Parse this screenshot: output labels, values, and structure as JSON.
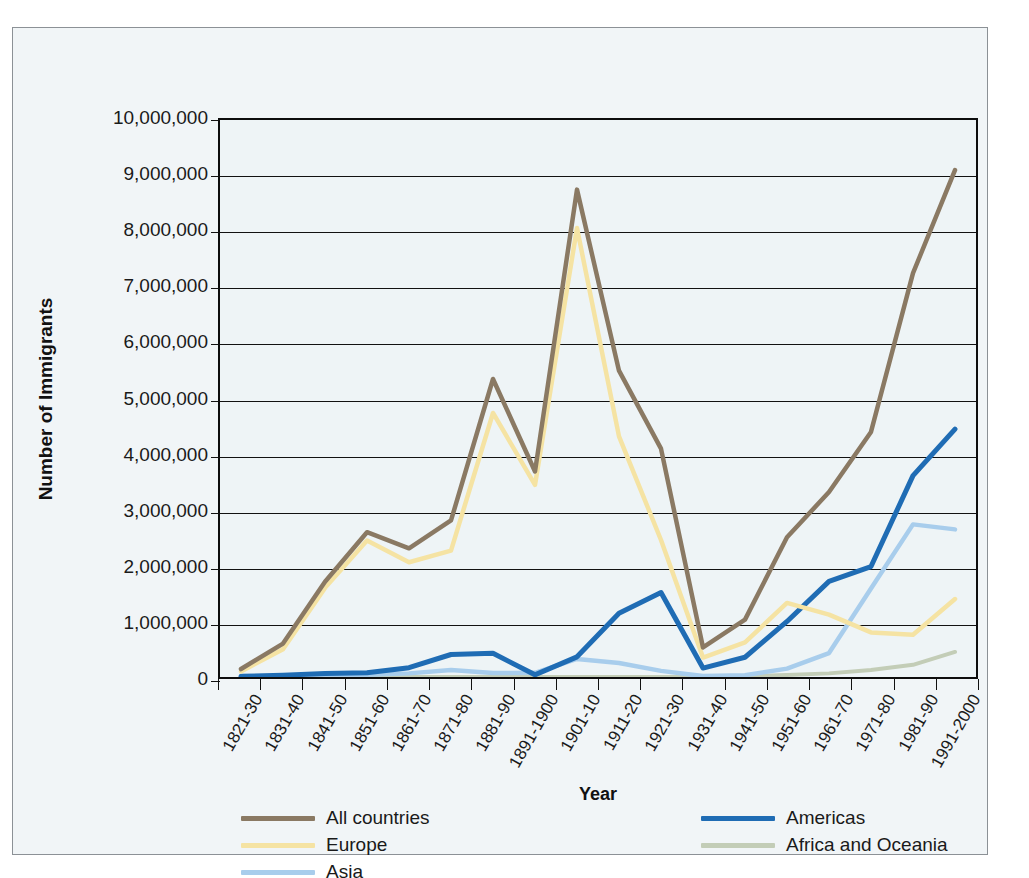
{
  "chart_data": {
    "type": "line",
    "title": "",
    "xlabel": "Year",
    "ylabel": "Number of Immigrants",
    "ylim": [
      0,
      10000000
    ],
    "ytick_step": 1000000,
    "grid": true,
    "legend_position": "bottom",
    "ytick_labels": [
      "0",
      "1,000,000",
      "2,000,000",
      "3,000,000",
      "4,000,000",
      "5,000,000",
      "6,000,000",
      "7,000,000",
      "8,000,000",
      "9,000,000",
      "10,000,000"
    ],
    "categories": [
      "1821-30",
      "1831-40",
      "1841-50",
      "1851-60",
      "1861-70",
      "1871-80",
      "1881-90",
      "1891-1900",
      "1901-10",
      "1911-20",
      "1921-30",
      "1931-40",
      "1941-50",
      "1951-60",
      "1961-70",
      "1971-80",
      "1981-90",
      "1991-2000"
    ],
    "series": [
      {
        "name": "All countries",
        "color": "#8a7963",
        "values": [
          143000,
          600000,
          1710000,
          2600000,
          2310000,
          2810000,
          5350000,
          3690000,
          8750000,
          5500000,
          4100000,
          530000,
          1030000,
          2510000,
          3320000,
          4400000,
          7250000,
          9100000
        ]
      },
      {
        "name": "Europe",
        "color": "#f5e3a3",
        "values": [
          100000,
          500000,
          1600000,
          2450000,
          2060000,
          2270000,
          4740000,
          3450000,
          8060000,
          4320000,
          2460000,
          350000,
          620000,
          1330000,
          1120000,
          800000,
          760000,
          1400000
        ]
      },
      {
        "name": "Asia",
        "color": "#a8cdec",
        "values": [
          0,
          0,
          0,
          42000,
          65000,
          125000,
          70000,
          75000,
          325000,
          250000,
          110000,
          16000,
          32000,
          150000,
          430000,
          1590000,
          2740000,
          2650000
        ]
      },
      {
        "name": "Americas",
        "color": "#1f6cb4",
        "values": [
          12000,
          33000,
          62000,
          75000,
          167000,
          404000,
          427000,
          39000,
          362000,
          1144000,
          1517000,
          160000,
          355000,
          997000,
          1716000,
          1983000,
          3615000,
          4450000
        ]
      },
      {
        "name": "Africa and Oceania",
        "color": "#c3cdb7",
        "values": [
          0,
          0,
          0,
          0,
          0,
          0,
          0,
          0,
          0,
          0,
          0,
          0,
          14000,
          36000,
          65000,
          125000,
          218000,
          450000
        ]
      }
    ]
  },
  "axis": {
    "y_title": "Number of Immigrants",
    "x_title": "Year"
  },
  "legend": {
    "left_column": [
      {
        "label": "All countries",
        "color": "#8a7963"
      },
      {
        "label": "Europe",
        "color": "#f5e3a3"
      },
      {
        "label": "Asia",
        "color": "#a8cdec"
      }
    ],
    "right_column": [
      {
        "label": "Americas",
        "color": "#1f6cb4"
      },
      {
        "label": "Africa and Oceania",
        "color": "#c3cdb7"
      }
    ]
  }
}
